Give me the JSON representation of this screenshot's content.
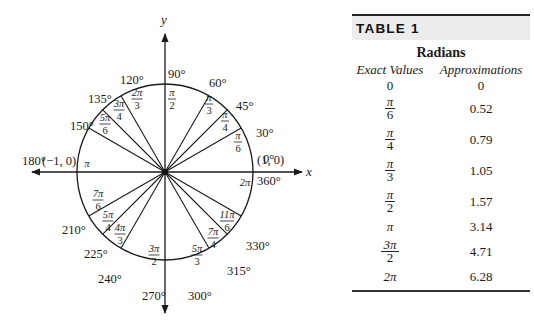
{
  "diagram": {
    "axes": {
      "x_label": "x",
      "y_label": "y"
    },
    "points": {
      "right": "(1, 0)",
      "left": "(−1, 0)"
    },
    "angles": [
      {
        "deg": 0,
        "deg_label": "0°",
        "rad_num": "",
        "rad_den": ""
      },
      {
        "deg": 30,
        "deg_label": "30°",
        "rad_num": "π",
        "rad_den": "6"
      },
      {
        "deg": 45,
        "deg_label": "45°",
        "rad_num": "π",
        "rad_den": "4"
      },
      {
        "deg": 60,
        "deg_label": "60°",
        "rad_num": "π",
        "rad_den": "3"
      },
      {
        "deg": 90,
        "deg_label": "90°",
        "rad_num": "π",
        "rad_den": "2"
      },
      {
        "deg": 120,
        "deg_label": "120°",
        "rad_num": "2π",
        "rad_den": "3"
      },
      {
        "deg": 135,
        "deg_label": "135°",
        "rad_num": "3π",
        "rad_den": "4"
      },
      {
        "deg": 150,
        "deg_label": "150°",
        "rad_num": "5π",
        "rad_den": "6"
      },
      {
        "deg": 180,
        "deg_label": "180°",
        "rad_num": "π",
        "rad_den": ""
      },
      {
        "deg": 210,
        "deg_label": "210°",
        "rad_num": "7π",
        "rad_den": "6"
      },
      {
        "deg": 225,
        "deg_label": "225°",
        "rad_num": "5π",
        "rad_den": "4"
      },
      {
        "deg": 240,
        "deg_label": "240°",
        "rad_num": "4π",
        "rad_den": "3"
      },
      {
        "deg": 270,
        "deg_label": "270°",
        "rad_num": "3π",
        "rad_den": "2"
      },
      {
        "deg": 300,
        "deg_label": "300°",
        "rad_num": "5π",
        "rad_den": "3"
      },
      {
        "deg": 315,
        "deg_label": "315°",
        "rad_num": "7π",
        "rad_den": "4"
      },
      {
        "deg": 330,
        "deg_label": "330°",
        "rad_num": "11π",
        "rad_den": "6"
      },
      {
        "deg": 360,
        "deg_label": "360°",
        "rad_num": "2π",
        "rad_den": ""
      }
    ]
  },
  "table": {
    "title": "TABLE 1",
    "group_heading": "Radians",
    "columns": [
      "Exact Values",
      "Approximations"
    ],
    "rows": [
      {
        "exact_num": "0",
        "exact_den": "",
        "approx": "0"
      },
      {
        "exact_num": "π",
        "exact_den": "6",
        "approx": "0.52"
      },
      {
        "exact_num": "π",
        "exact_den": "4",
        "approx": "0.79"
      },
      {
        "exact_num": "π",
        "exact_den": "3",
        "approx": "1.05"
      },
      {
        "exact_num": "π",
        "exact_den": "2",
        "approx": "1.57"
      },
      {
        "exact_num": "π",
        "exact_den": "",
        "approx": "3.14"
      },
      {
        "exact_num": "3π",
        "exact_den": "2",
        "approx": "4.71"
      },
      {
        "exact_num": "2π",
        "exact_den": "",
        "approx": "6.28"
      }
    ]
  }
}
